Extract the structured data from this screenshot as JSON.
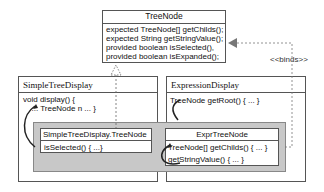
{
  "treenode": {
    "title": "TreeNode",
    "members": [
      "expected TreeNode[] getChilds();",
      "expected String getStringValue();",
      "provided boolean isSelected(),",
      "provided boolean isExpanded();"
    ]
  },
  "simple_tree_display": {
    "title": "SimpleTreeDisplay",
    "lines": [
      "void display() {",
      "  ... TreeNode n ... }"
    ],
    "inner": {
      "title": "SimpleTreeDisplay.TreeNode",
      "members": [
        "isSelected() { ...}"
      ]
    }
  },
  "expression_display": {
    "title": "ExpressionDisplay",
    "lines": [
      "TreeNode getRoot() { ... }"
    ],
    "inner": {
      "title": "ExprTreeNode",
      "members": [
        "TreeNode[] getChilds() { ... }",
        "getStringValue() { ... }"
      ]
    }
  },
  "binds_label": "<<binds>>",
  "colors": {
    "border": "#555555",
    "merge_fill": "#c8c8c8",
    "arrow": "#777777"
  }
}
